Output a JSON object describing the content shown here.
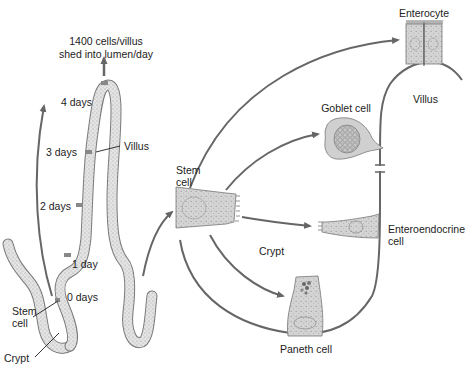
{
  "diagram": {
    "topic": "Intestinal epithelial cell renewal from crypt stem cells",
    "colors": {
      "arrow": "#666666",
      "epithelium_fill": "#e2e2e2",
      "epithelium_stroke": "#7a7a7a",
      "cell_fill": "#d6d6d6",
      "band_marker": "#888888"
    },
    "left_panel": {
      "shed_label_line1": "1400 cells/villus",
      "shed_label_line2": "shed into lumen/day",
      "timepoints": [
        {
          "label": "4 days"
        },
        {
          "label": "3 days"
        },
        {
          "label": "2 days"
        },
        {
          "label": "1 day"
        },
        {
          "label": "0 days"
        }
      ],
      "villus_label": "Villus",
      "stem_cell_label_line1": "Stem",
      "stem_cell_label_line2": "cell",
      "crypt_label": "Crypt"
    },
    "right_panel": {
      "stem_cell_label_line1": "Stem",
      "stem_cell_label_line2": "cell",
      "crypt_label": "Crypt",
      "villus_label": "Villus",
      "differentiated_cells": [
        {
          "name": "Enterocyte",
          "line1": "Enterocyte",
          "line2": ""
        },
        {
          "name": "Goblet cell",
          "line1": "Goblet cell",
          "line2": ""
        },
        {
          "name": "Enteroendocrine cell",
          "line1": "Enteroendocrine",
          "line2": "cell"
        },
        {
          "name": "Paneth cell",
          "line1": "Paneth cell",
          "line2": ""
        }
      ]
    }
  }
}
